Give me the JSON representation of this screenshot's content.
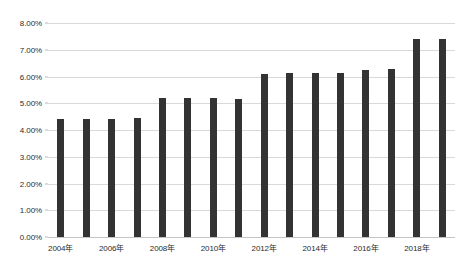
{
  "chart_data": {
    "type": "bar",
    "title": "",
    "xlabel": "",
    "ylabel": "",
    "ylim": [
      0,
      0.08
    ],
    "grid": true,
    "legend": false,
    "bar_color": "#333333",
    "gridline_color": "#d9d9d9",
    "y_tick_labels": [
      "0.00%",
      "1.00%",
      "2.00%",
      "3.00%",
      "4.00%",
      "5.00%",
      "6.00%",
      "7.00%",
      "8.00%"
    ],
    "y_tick_values": [
      0,
      0.01,
      0.02,
      0.03,
      0.04,
      0.05,
      0.06,
      0.07,
      0.08
    ],
    "categories": [
      "2004年",
      "2005年",
      "2006年",
      "2007年",
      "2008年",
      "2009年",
      "2010年",
      "2011年",
      "2012年",
      "2013年",
      "2014年",
      "2015年",
      "2016年",
      "2017年",
      "2018年",
      "2019年"
    ],
    "x_tick_labels_shown": [
      "2004年",
      "2006年",
      "2008年",
      "2010年",
      "2012年",
      "2014年",
      "2016年",
      "2018年"
    ],
    "x_tick_label_indices": [
      0,
      2,
      4,
      6,
      8,
      10,
      12,
      14
    ],
    "values": [
      0.044,
      0.0442,
      0.0443,
      0.0445,
      0.0518,
      0.052,
      0.0518,
      0.0516,
      0.061,
      0.0612,
      0.0613,
      0.0615,
      0.0625,
      0.0627,
      0.074,
      0.074
    ]
  }
}
